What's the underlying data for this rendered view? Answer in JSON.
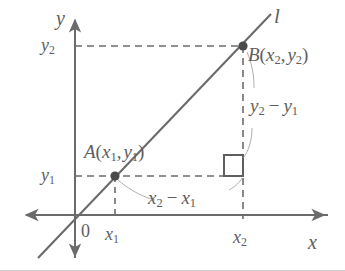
{
  "figure": {
    "kind": "coordinate-plane-slope-diagram",
    "background_color": "#ffffff",
    "stroke_color": "#6b6b6b",
    "text_color": "#5e5e5e",
    "point_color": "#4a4a4a",
    "width": 345,
    "height": 271
  },
  "axes": {
    "y_axis_label": "y",
    "x_axis_label": "x",
    "origin_label": "0",
    "origin_px": {
      "x": 75,
      "y": 215
    },
    "x_axis_y_px": 215,
    "y_axis_x_px": 75,
    "x_axis_left_end_px": 22,
    "x_axis_right_end_px": 328,
    "y_axis_top_end_px": 16,
    "y_axis_bottom_end_px": 260,
    "arrows": [
      "x-left",
      "x-right",
      "y-up",
      "y-down"
    ]
  },
  "line": {
    "label": "l",
    "start_px": {
      "x": 38,
      "y": 258
    },
    "end_px": {
      "x": 271,
      "y": 14
    }
  },
  "ticks": {
    "x": [
      {
        "label_text": "x",
        "label_sub": "1",
        "px": 115
      },
      {
        "label_text": "x",
        "label_sub": "2",
        "px": 243
      }
    ],
    "y": [
      {
        "label_text": "y",
        "label_sub": "2",
        "px": 46
      },
      {
        "label_text": "y",
        "label_sub": "1",
        "px": 176
      }
    ]
  },
  "points": [
    {
      "name": "A",
      "label_main": "A",
      "label_open": "(",
      "label_x": "x",
      "label_x_sub": "1",
      "label_comma": ",",
      "label_y": "y",
      "label_y_sub": "1",
      "label_close": ")",
      "px": {
        "x": 115,
        "y": 176
      }
    },
    {
      "name": "B",
      "label_main": "B",
      "label_open": "(",
      "label_x": "x",
      "label_x_sub": "2",
      "label_comma": ",",
      "label_y": "y",
      "label_y_sub": "2",
      "label_close": ")",
      "px": {
        "x": 243,
        "y": 46
      }
    }
  ],
  "annotations": {
    "rise": {
      "lead": "y",
      "lead_sub": "2",
      "minus": "−",
      "trail": "y",
      "trail_sub": "1"
    },
    "run": {
      "lead": "x",
      "lead_sub": "2",
      "minus": "−",
      "trail": "x",
      "trail_sub": "1"
    }
  },
  "right_angle_marker": {
    "x_px": 224,
    "y_px": 155,
    "size_px": 19
  },
  "guides": [
    {
      "name": "y2-horizontal",
      "from": {
        "x": 75,
        "y": 46
      },
      "to": {
        "x": 243,
        "y": 46
      }
    },
    {
      "name": "y1-horizontal",
      "from": {
        "x": 75,
        "y": 176
      },
      "to": {
        "x": 243,
        "y": 176
      }
    },
    {
      "name": "x1-vertical",
      "from": {
        "x": 115,
        "y": 176
      },
      "to": {
        "x": 115,
        "y": 218
      }
    },
    {
      "name": "x2-vertical",
      "from": {
        "x": 243,
        "y": 46
      },
      "to": {
        "x": 243,
        "y": 218
      }
    }
  ]
}
